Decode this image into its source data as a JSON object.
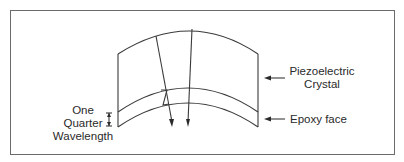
{
  "diagram": {
    "type": "transducer-cross-section",
    "labels": {
      "piezo_line1": "Piezoelectric",
      "piezo_line2": "Crystal",
      "epoxy": "Epoxy face",
      "quarter_line1": "One",
      "quarter_line2": "Quarter",
      "quarter_line3": "Wavelength"
    },
    "colors": {
      "line": "#3a3a3a",
      "frame": "#6b6b6b",
      "background": "#ffffff"
    }
  }
}
